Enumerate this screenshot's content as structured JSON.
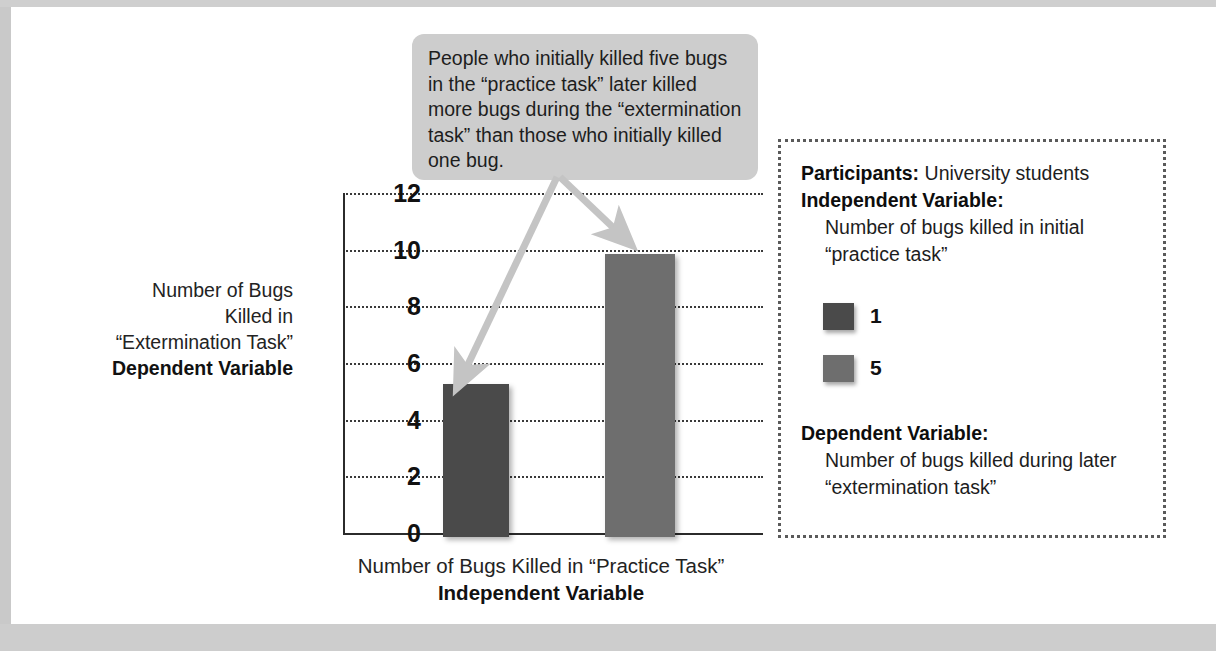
{
  "callout": {
    "text": "People who initially killed five bugs in the “practice task” later killed more bugs during the “extermination task” than those who initially killed one bug."
  },
  "axes": {
    "y_title_plain": "Number of Bugs Killed in “Extermination Task”",
    "y_title_bold": "Dependent Variable",
    "x_title_plain": "Number of Bugs Killed in “Practice Task”",
    "x_title_bold": "Independent Variable"
  },
  "info": {
    "participants_label": "Participants:",
    "participants_value": "University students",
    "iv_label": "Independent Variable:",
    "iv_value": "Number of bugs killed in initial “practice task”",
    "dv_label": "Dependent Variable:",
    "dv_value": "Number of bugs killed during later “extermination task”",
    "legend": [
      {
        "key": "1",
        "color": "#4a4a4a"
      },
      {
        "key": "5",
        "color": "#6e6e6e"
      }
    ]
  },
  "colors": {
    "bar_one": "#4a4a4a",
    "bar_five": "#6e6e6e",
    "callout_bg": "#cdcdcd",
    "arrow": "#c4c4c4",
    "axis": "#2b2b2b",
    "grid": "#3a3a3a"
  },
  "chart_data": {
    "type": "bar",
    "title": "",
    "categories": [
      "1",
      "5"
    ],
    "values": [
      5.4,
      10.0
    ],
    "xlabel": "Number of Bugs Killed in “Practice Task”",
    "ylabel": "Number of Bugs Killed in “Extermination Task”",
    "ylim": [
      0,
      12
    ],
    "ytick_labels": [
      "0",
      "2",
      "4",
      "6",
      "8",
      "10",
      "12"
    ],
    "ytick_values": [
      0,
      2,
      4,
      6,
      8,
      10,
      12
    ],
    "grid": true,
    "grid_style": "dotted-horizontal",
    "legend_position": "right-panel",
    "legend_entries": [
      "1",
      "5"
    ],
    "series": [
      {
        "name": "Number of bugs killed during later “extermination task”",
        "values": [
          5.4,
          10.0
        ]
      }
    ],
    "annotations": [
      "People who initially killed five bugs in the “practice task” later killed more bugs during the “extermination task” than those who initially killed one bug."
    ]
  }
}
